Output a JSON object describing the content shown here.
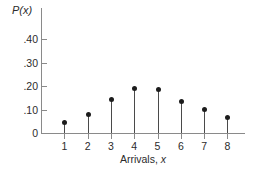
{
  "chart_data": {
    "type": "scatter",
    "title": "",
    "subtitle": "",
    "xlabel": "Arrivals, x",
    "ylabel": "P(x)",
    "categories": [
      1,
      2,
      3,
      4,
      5,
      6,
      7,
      8
    ],
    "values": [
      0.045,
      0.082,
      0.143,
      0.191,
      0.188,
      0.135,
      0.103,
      0.068
    ],
    "x_tick_labels": [
      "1",
      "2",
      "3",
      "4",
      "5",
      "6",
      "7",
      "8"
    ],
    "y_tick_labels": [
      "0",
      ".10",
      ".20",
      ".30",
      ".40"
    ],
    "y_tick_values": [
      0,
      0.1,
      0.2,
      0.3,
      0.4
    ],
    "xlim": [
      0.4,
      8.9
    ],
    "ylim": [
      0,
      0.44
    ],
    "grid": false,
    "legend": null,
    "legend_position": "none",
    "marker_style": "filled-circle",
    "stems": true,
    "annotations": []
  },
  "figure": {
    "y_axis_title": "P(x)",
    "x_axis_title_static": "Arrivals,",
    "x_axis_title_variable": "x",
    "colors": {
      "marker": "#1c1c1c",
      "stem": "#4a4a4a",
      "axis": "#8a8a8a",
      "text": "#2b2b2b",
      "background": "#ffffff"
    }
  }
}
